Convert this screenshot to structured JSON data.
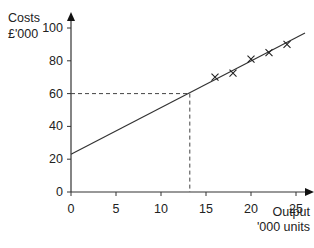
{
  "chart_data": {
    "type": "scatter",
    "title": "",
    "ylabel": "Costs £'000",
    "ylabel_lines": [
      "Costs",
      "£'000"
    ],
    "xlabel": "Output '000 units",
    "xlabel_lines": [
      "Output",
      "'000 units"
    ],
    "xlim": [
      0,
      26
    ],
    "ylim": [
      0,
      100
    ],
    "x_ticks": [
      0,
      5,
      10,
      15,
      20,
      25
    ],
    "y_ticks": [
      0,
      20,
      40,
      60,
      80,
      100
    ],
    "grid": false,
    "legend": null,
    "series": [
      {
        "name": "Observed costs",
        "marker": "x",
        "x": [
          16,
          18,
          20,
          22,
          24
        ],
        "y": [
          70,
          72.5,
          81,
          85,
          90
        ]
      },
      {
        "name": "Line of best fit",
        "type": "line",
        "x": [
          0,
          26
        ],
        "y": [
          23,
          97
        ]
      }
    ],
    "annotations": [
      {
        "type": "dashed-guide",
        "description": "Reading at cost 60 gives output ~13.2",
        "x": 13.2,
        "y": 60
      }
    ]
  }
}
